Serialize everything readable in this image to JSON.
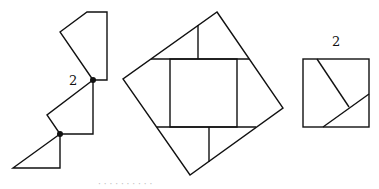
{
  "figure": {
    "left_label": "2",
    "right_label": "2",
    "caption_fragment": "· · ·  · · · ·  · · ·"
  },
  "colors": {
    "stroke": "#111111",
    "background": "#ffffff"
  }
}
